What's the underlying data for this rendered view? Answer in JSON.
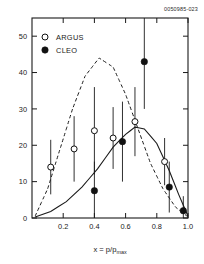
{
  "figure": {
    "corner_id": "0050985-023",
    "legend": [
      {
        "label": "ARGUS",
        "marker": "open-circle"
      },
      {
        "label": "CLEO",
        "marker": "filled-circle"
      }
    ]
  },
  "chart_data": {
    "type": "scatter",
    "title": "",
    "xlabel": "x = p/p",
    "xlabel_sub": "max",
    "ylabel": "",
    "xlim": [
      0.0,
      1.0
    ],
    "ylim": [
      0,
      55
    ],
    "xticks": [
      0.2,
      0.4,
      0.6,
      0.8,
      1.0
    ],
    "xtick_labels": [
      "0.2",
      "0.4",
      "0.6",
      "0.8",
      "1.0"
    ],
    "yticks": [
      0,
      10,
      20,
      30,
      40,
      50
    ],
    "ytick_labels": [
      "0",
      "10",
      "20",
      "30",
      "40",
      "50"
    ],
    "grid": false,
    "legend_position": "upper-left",
    "series": [
      {
        "name": "ARGUS",
        "marker": "open-circle",
        "points": [
          {
            "x": 0.12,
            "y": 14.0,
            "yerr": 7.5
          },
          {
            "x": 0.27,
            "y": 19.0,
            "yerr": 9.0
          },
          {
            "x": 0.4,
            "y": 24.0,
            "yerr": 12.0
          },
          {
            "x": 0.52,
            "y": 22.0,
            "yerr": 8.5
          },
          {
            "x": 0.66,
            "y": 26.5,
            "yerr": 9.5
          },
          {
            "x": 0.85,
            "y": 15.5,
            "yerr": 6.5
          }
        ]
      },
      {
        "name": "CLEO",
        "marker": "filled-circle",
        "points": [
          {
            "x": 0.4,
            "y": 7.5,
            "yerr": 8.0
          },
          {
            "x": 0.58,
            "y": 21.0,
            "yerr": 11.0
          },
          {
            "x": 0.72,
            "y": 43.0,
            "yerr": 13.0
          },
          {
            "x": 0.88,
            "y": 8.5,
            "yerr": 7.0
          },
          {
            "x": 0.97,
            "y": 2.0,
            "yerr": 4.0
          }
        ]
      }
    ],
    "curves": [
      {
        "name": "dashed-model",
        "style": "dashed",
        "points": [
          {
            "x": 0.02,
            "y": 0.5
          },
          {
            "x": 0.1,
            "y": 8.0
          },
          {
            "x": 0.18,
            "y": 19.0
          },
          {
            "x": 0.26,
            "y": 30.0
          },
          {
            "x": 0.34,
            "y": 39.0
          },
          {
            "x": 0.43,
            "y": 44.0
          },
          {
            "x": 0.52,
            "y": 41.5
          },
          {
            "x": 0.6,
            "y": 34.0
          },
          {
            "x": 0.68,
            "y": 24.5
          },
          {
            "x": 0.76,
            "y": 15.0
          },
          {
            "x": 0.84,
            "y": 8.0
          },
          {
            "x": 0.92,
            "y": 3.0
          },
          {
            "x": 1.0,
            "y": 0.3
          }
        ]
      },
      {
        "name": "solid-model",
        "style": "solid",
        "points": [
          {
            "x": 0.02,
            "y": 0.3
          },
          {
            "x": 0.12,
            "y": 1.8
          },
          {
            "x": 0.22,
            "y": 4.5
          },
          {
            "x": 0.32,
            "y": 8.5
          },
          {
            "x": 0.42,
            "y": 13.5
          },
          {
            "x": 0.52,
            "y": 19.5
          },
          {
            "x": 0.6,
            "y": 23.0
          },
          {
            "x": 0.66,
            "y": 25.0
          },
          {
            "x": 0.72,
            "y": 24.5
          },
          {
            "x": 0.8,
            "y": 20.5
          },
          {
            "x": 0.88,
            "y": 13.0
          },
          {
            "x": 0.94,
            "y": 6.5
          },
          {
            "x": 1.0,
            "y": 0.5
          }
        ]
      }
    ]
  }
}
